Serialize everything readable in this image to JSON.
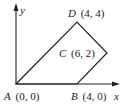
{
  "diagram": {
    "axes": {
      "x_label": "x",
      "y_label": "y"
    },
    "points": [
      {
        "name": "A",
        "coords": "(0, 0)",
        "px": [
          16,
          84
        ]
      },
      {
        "name": "B",
        "coords": "(4, 0)",
        "px": [
          77,
          84
        ]
      },
      {
        "name": "C",
        "coords": "(6, 2)",
        "px": [
          107,
          53
        ]
      },
      {
        "name": "D",
        "coords": "(4, 4)",
        "px": [
          77,
          22
        ]
      }
    ],
    "shape": "quadrilateral ABCD"
  }
}
